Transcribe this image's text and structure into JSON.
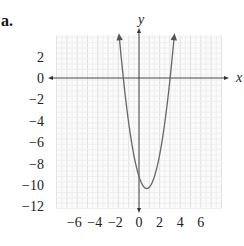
{
  "figure": {
    "label": "a."
  },
  "chart_data": {
    "type": "line",
    "title": "",
    "subtitle": "",
    "xlabel": "x",
    "ylabel": "y",
    "xlim": [
      -8,
      8
    ],
    "ylim": [
      -12,
      4
    ],
    "grid": true,
    "legend": null,
    "x_ticks": [
      -6,
      -4,
      -2,
      0,
      2,
      4,
      6
    ],
    "x_tick_labels": [
      "−6",
      "−4",
      "−2",
      "0",
      "2",
      "4",
      "6"
    ],
    "y_ticks": [
      2,
      0,
      -2,
      -4,
      -6,
      -8,
      -10,
      -12
    ],
    "y_tick_labels": [
      "2",
      "0",
      "−2",
      "−4",
      "−6",
      "−8",
      "−10",
      "−12"
    ],
    "series": [
      {
        "name": "parabola",
        "description": "Upward-opening parabola with arrowheads at both ends; vertex near (0.75, -10.3)",
        "equation_estimate": "y = 2x^2 - 3x - 9.2",
        "x": [
          -1.9,
          -1.5,
          -1,
          -0.5,
          0,
          0.5,
          0.75,
          1,
          1.5,
          2,
          2.5,
          3,
          3.4
        ],
        "values": [
          3.72,
          0.8,
          -4.2,
          -7.2,
          -9.2,
          -10.2,
          -10.33,
          -10.2,
          -9.2,
          -7.2,
          -4.2,
          0.8,
          4.72
        ]
      }
    ],
    "annotations": [
      "Arrowheads at both ends of curve",
      "Arrowheads on positive x and y axes"
    ]
  }
}
